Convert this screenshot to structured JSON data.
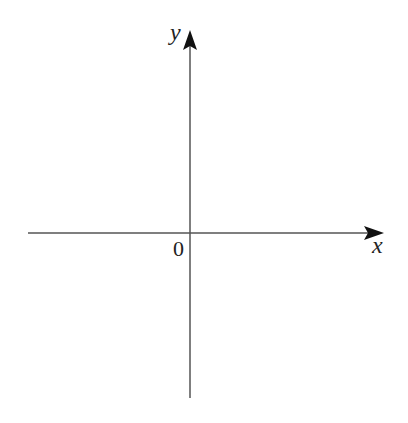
{
  "diagram": {
    "type": "cartesian-axes",
    "x_axis": {
      "label": "x",
      "from": [
        28,
        233
      ],
      "to": [
        384,
        233
      ]
    },
    "y_axis": {
      "label": "y",
      "from": [
        190,
        398
      ],
      "to": [
        190,
        30
      ]
    },
    "origin": {
      "label": "0",
      "position": [
        190,
        233
      ]
    },
    "colors": {
      "axis": "#555555",
      "arrowhead": "#111111",
      "text": "#222222",
      "background": "#ffffff"
    }
  }
}
